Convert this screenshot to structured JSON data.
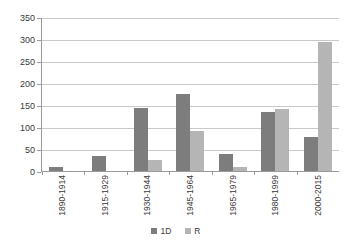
{
  "chart_data": {
    "type": "bar",
    "title": "",
    "subtitle": "",
    "xlabel": "",
    "ylabel": "",
    "ylim": [
      0,
      350
    ],
    "ytick_step": 50,
    "yticks": [
      0,
      50,
      100,
      150,
      200,
      250,
      300,
      350
    ],
    "grid": true,
    "grid_axis": "y",
    "legend_position": "bottom",
    "orientation": "vertical",
    "categories": [
      "1890-1914",
      "1915-1929",
      "1930-1944",
      "1945-1964",
      "1965-1979",
      "1980-1999",
      "2000-2015"
    ],
    "series": [
      {
        "name": "1D",
        "color": "#7d7d7d",
        "values": [
          10,
          35,
          143,
          175,
          38,
          133,
          78
        ]
      },
      {
        "name": "R",
        "color": "#b5b5b5",
        "values": [
          0,
          0,
          25,
          90,
          10,
          140,
          293
        ]
      }
    ]
  },
  "legend": {
    "items": [
      {
        "label": "1D",
        "color": "#7d7d7d"
      },
      {
        "label": "R",
        "color": "#b5b5b5"
      }
    ]
  },
  "axis": {
    "y_labels": [
      "350",
      "300",
      "250",
      "200",
      "150",
      "100",
      "50",
      "0"
    ],
    "x_labels": [
      "1890-1914",
      "1915-1929",
      "1930-1944",
      "1945-1964",
      "1965-1979",
      "1980-1999",
      "2000-2015"
    ]
  },
  "colors": {
    "series_1d": "#7d7d7d",
    "series_r": "#b5b5b5",
    "gridline": "#c9c9c9",
    "axis": "#9a9a9a",
    "text": "#3a3a3a",
    "background": "#ffffff"
  }
}
